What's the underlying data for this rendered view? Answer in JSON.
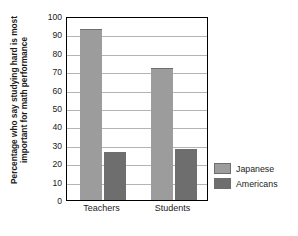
{
  "chart_data": {
    "type": "bar",
    "title": "",
    "xlabel": "",
    "ylabel": "Percentage who say studying hard is most important for math performance",
    "ylabel_lines": [
      "Percentage who say studying hard is most",
      "important for math performance"
    ],
    "categories": [
      "Teachers",
      "Students"
    ],
    "series": [
      {
        "name": "Japanese",
        "values": [
          93,
          72
        ],
        "color": "#9c9c9c"
      },
      {
        "name": "Americans",
        "values": [
          26,
          27.5
        ],
        "color": "#6e6e6e"
      }
    ],
    "ylim": [
      0,
      100
    ],
    "yticks": [
      100,
      90,
      80,
      70,
      60,
      50,
      40,
      30,
      20,
      10,
      0
    ],
    "ytick_labels": [
      "100",
      "90",
      "80",
      "70",
      "60",
      "50",
      "40",
      "30",
      "20",
      "10",
      "0"
    ],
    "grid": true,
    "grid_axis": "y",
    "legend_position": "right",
    "legend_entries": [
      "Japanese",
      "Americans"
    ],
    "annotations": []
  },
  "style": {
    "bar_japanese_color": "#9c9c9c",
    "bar_americans_color": "#6e6e6e",
    "bar_border_color": "#6e6e6e",
    "gridline_color": "#b4b4b4",
    "axis_color": "#000000",
    "text_color": "#1b1b1b",
    "background": "#ffffff"
  }
}
